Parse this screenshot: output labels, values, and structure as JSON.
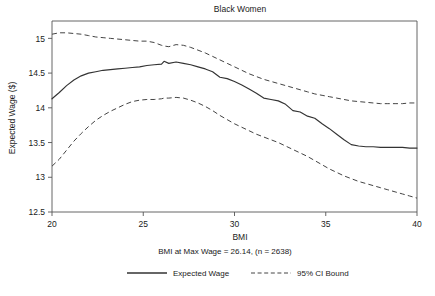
{
  "chart_data": {
    "type": "line",
    "title": "Black Women",
    "subtitle": "BMI at Max Wage = 26.14, (n = 2638)",
    "xlabel": "BMI",
    "ylabel": "Expected Wage ($)",
    "xlim": [
      20,
      40
    ],
    "ylim": [
      12.5,
      15.25
    ],
    "grid": false,
    "legend_position": "bottom",
    "xticks": [
      20,
      25,
      30,
      35,
      40
    ],
    "xtick_labels": [
      "20",
      "25",
      "30",
      "35",
      "40"
    ],
    "yticks": [
      12.5,
      13,
      13.5,
      14,
      14.5,
      15
    ],
    "ytick_labels": [
      "12.5",
      "13",
      "13.5",
      "14",
      "14.5",
      "15"
    ],
    "x": [
      20.0,
      20.4,
      20.8,
      21.2,
      21.6,
      22.0,
      22.4,
      22.8,
      23.2,
      23.6,
      24.0,
      24.4,
      24.8,
      25.2,
      25.6,
      26.0,
      26.14,
      26.4,
      26.8,
      27.2,
      27.6,
      28.0,
      28.4,
      28.8,
      29.2,
      29.6,
      30.0,
      30.4,
      30.8,
      31.2,
      31.6,
      32.0,
      32.4,
      32.8,
      33.2,
      33.6,
      34.0,
      34.4,
      34.8,
      35.2,
      35.6,
      36.0,
      36.4,
      36.8,
      37.2,
      37.6,
      38.0,
      38.4,
      38.8,
      39.2,
      39.6,
      40.0
    ],
    "series": [
      {
        "name": "Expected Wage",
        "style": "solid",
        "values": [
          14.13,
          14.22,
          14.32,
          14.4,
          14.46,
          14.5,
          14.52,
          14.54,
          14.55,
          14.56,
          14.57,
          14.58,
          14.59,
          14.61,
          14.62,
          14.63,
          14.67,
          14.64,
          14.66,
          14.64,
          14.62,
          14.59,
          14.56,
          14.52,
          14.44,
          14.42,
          14.38,
          14.33,
          14.27,
          14.21,
          14.14,
          14.12,
          14.1,
          14.05,
          13.96,
          13.94,
          13.88,
          13.85,
          13.77,
          13.7,
          13.62,
          13.54,
          13.47,
          13.45,
          13.44,
          13.44,
          13.43,
          13.43,
          13.43,
          13.43,
          13.42,
          13.42
        ]
      },
      {
        "name": "95% CI Bound",
        "style": "dashed",
        "bound": "upper",
        "values": [
          15.06,
          15.08,
          15.08,
          15.07,
          15.06,
          15.04,
          15.02,
          15.01,
          15.0,
          14.99,
          14.98,
          14.97,
          14.96,
          14.96,
          14.94,
          14.9,
          14.89,
          14.88,
          14.91,
          14.9,
          14.87,
          14.83,
          14.79,
          14.74,
          14.69,
          14.64,
          14.59,
          14.54,
          14.49,
          14.45,
          14.41,
          14.38,
          14.35,
          14.32,
          14.29,
          14.26,
          14.23,
          14.2,
          14.18,
          14.16,
          14.14,
          14.12,
          14.1,
          14.09,
          14.08,
          14.07,
          14.06,
          14.06,
          14.06,
          14.06,
          14.07,
          14.07
        ]
      },
      {
        "name": "95% CI Bound",
        "style": "dashed",
        "bound": "lower",
        "values": [
          13.16,
          13.26,
          13.39,
          13.52,
          13.63,
          13.73,
          13.82,
          13.89,
          13.95,
          14.0,
          14.05,
          14.09,
          14.11,
          14.12,
          14.12,
          14.13,
          14.14,
          14.14,
          14.15,
          14.14,
          14.11,
          14.07,
          14.02,
          13.96,
          13.89,
          13.83,
          13.77,
          13.72,
          13.67,
          13.62,
          13.58,
          13.54,
          13.5,
          13.45,
          13.4,
          13.35,
          13.3,
          13.24,
          13.18,
          13.12,
          13.07,
          13.02,
          12.98,
          12.94,
          12.91,
          12.88,
          12.85,
          12.82,
          12.79,
          12.76,
          12.73,
          12.7
        ]
      }
    ],
    "legend": [
      {
        "label": "Expected Wage",
        "style": "solid"
      },
      {
        "label": "95% CI Bound",
        "style": "dashed"
      }
    ]
  }
}
